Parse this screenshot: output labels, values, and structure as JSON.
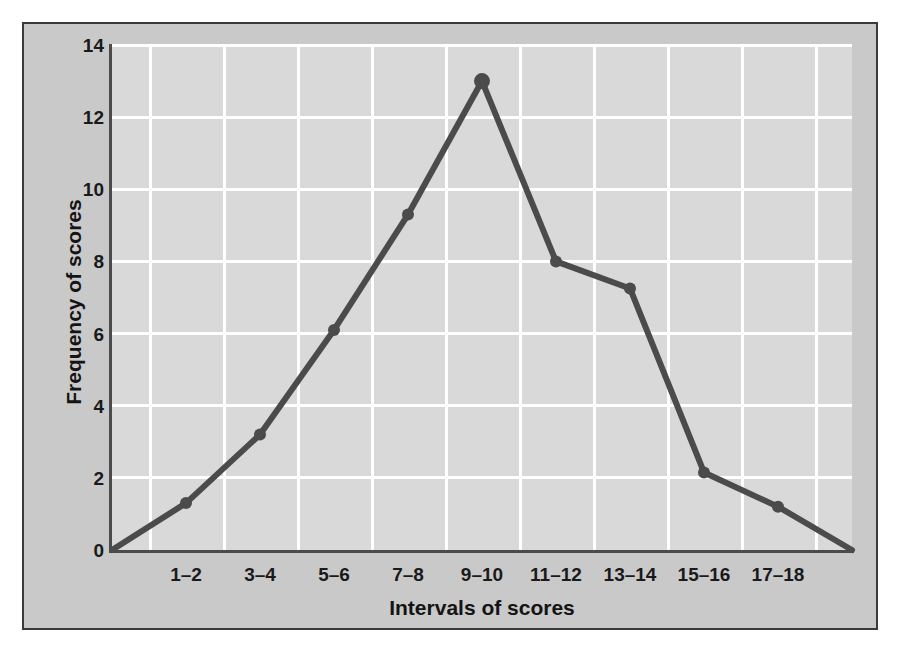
{
  "chart_data": {
    "type": "line",
    "title": "",
    "xlabel": "Intervals of scores",
    "ylabel": "Frequency of scores",
    "categories": [
      "1–2",
      "3–4",
      "5–6",
      "7–8",
      "9–10",
      "11–12",
      "13–14",
      "15–16",
      "17–18"
    ],
    "values": [
      1.3,
      3.2,
      6.1,
      9.3,
      13,
      8,
      7.25,
      2.15,
      1.2
    ],
    "anchor_start": {
      "x_fraction": 0.0,
      "value": 0
    },
    "anchor_end": {
      "x_fraction": 1.0,
      "value": 0
    },
    "yticks": [
      0,
      2,
      4,
      6,
      8,
      10,
      12,
      14
    ],
    "ylim": [
      0,
      14
    ],
    "grid": true,
    "legend": "none",
    "markers": true,
    "series_name": "Frequency of scores",
    "colors": {
      "line": "#4b4b4b",
      "plot_background": "#d9d9d9",
      "figure_background": "#c9c9c9",
      "gridline": "#ffffff",
      "axis": "#4b4b4b",
      "text": "#1a1a1a",
      "frame_border": "#3a3a3a"
    }
  }
}
